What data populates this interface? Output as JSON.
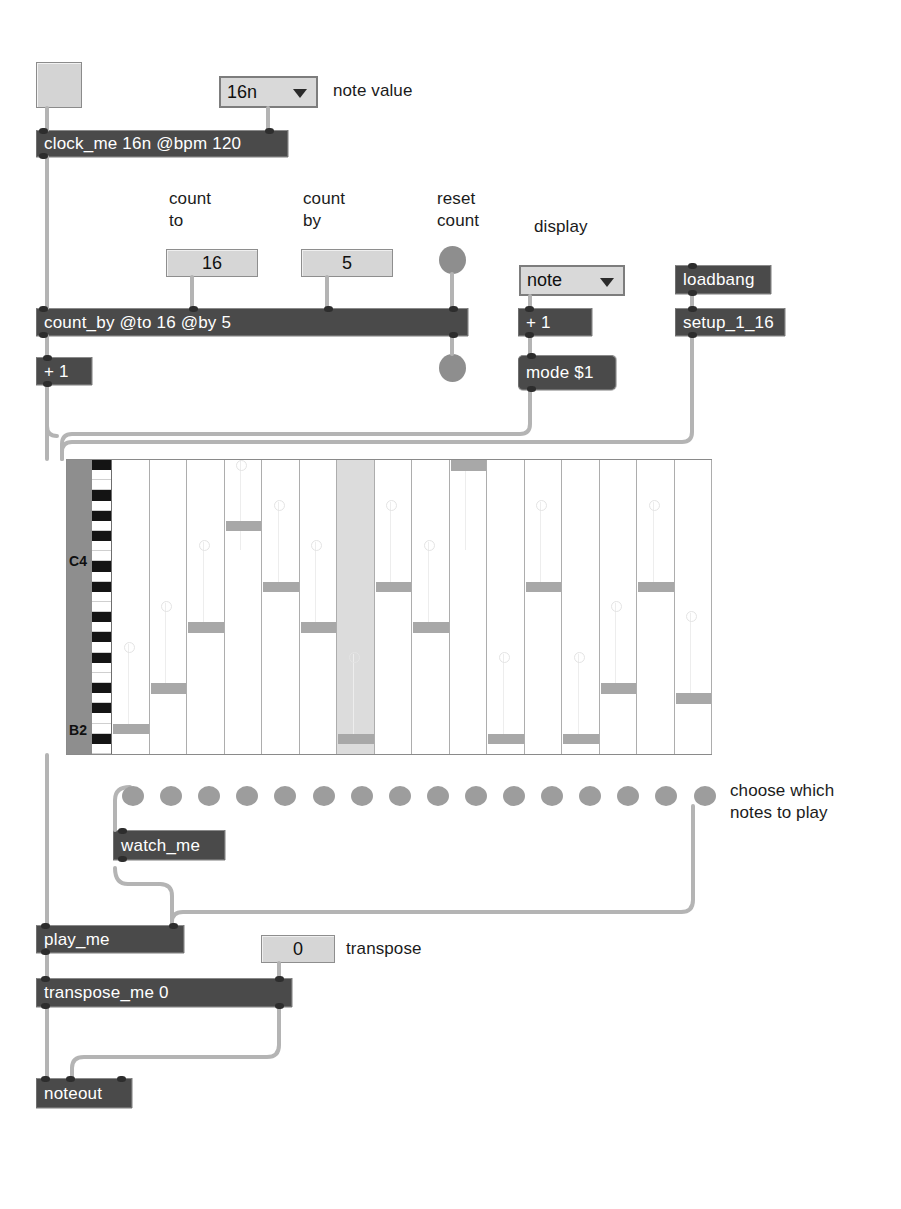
{
  "patch": {
    "title": "step sequencer patch"
  },
  "comments": {
    "note_value": "note value",
    "count_to": "count\nto",
    "count_by": "count\nby",
    "reset_count": "reset\ncount",
    "display": "display",
    "choose_notes": "choose which\nnotes to play",
    "transpose": "transpose"
  },
  "objects": {
    "clock_me": "clock_me 16n @bpm 120",
    "count_by": "count_by @to 16 @by 5",
    "plus_one_left": "+ 1",
    "plus_one_display": "+ 1",
    "mode_msg": "mode $1",
    "loadbang": "loadbang",
    "setup": "setup_1_16",
    "watch_me": "watch_me",
    "play_me": "play_me",
    "transpose_me": "transpose_me 0",
    "noteout": "noteout"
  },
  "controls": {
    "note_value_menu": {
      "value": "16n",
      "icon": "chevron-down-icon"
    },
    "display_menu": {
      "value": "note",
      "icon": "chevron-down-icon"
    },
    "count_to_number": "16",
    "count_by_number": "5",
    "transpose_number": "0",
    "start_toggle": {
      "state": "off"
    },
    "reset_bang_top": {
      "label": "bang"
    },
    "reset_bang_bottom": {
      "label": "bang"
    }
  },
  "colors": {
    "object_fill": "#4a4a4a",
    "object_text": "#ffffff",
    "widget_fill": "#d6d6d6",
    "cord": "#b4b4b4",
    "note_fill": "#a8a8a8",
    "playhead_fill": "#dcdcdc",
    "keyspine_fill": "#8e8e8e",
    "dot_fill": "#9d9d9d",
    "background": "#ffffff"
  },
  "sequencer": {
    "steps": 16,
    "pitch_top_label": "C4",
    "pitch_bottom_label": "B2",
    "playhead_step": 7,
    "rows": 29,
    "notes": [
      {
        "step": 1,
        "row": 26
      },
      {
        "step": 2,
        "row": 22
      },
      {
        "step": 3,
        "row": 16
      },
      {
        "step": 4,
        "row": 6
      },
      {
        "step": 5,
        "row": 12
      },
      {
        "step": 6,
        "row": 16
      },
      {
        "step": 7,
        "row": 27
      },
      {
        "step": 8,
        "row": 12
      },
      {
        "step": 9,
        "row": 16
      },
      {
        "step": 10,
        "row": 0
      },
      {
        "step": 11,
        "row": 27
      },
      {
        "step": 12,
        "row": 12
      },
      {
        "step": 13,
        "row": 27
      },
      {
        "step": 14,
        "row": 22
      },
      {
        "step": 15,
        "row": 12
      },
      {
        "step": 16,
        "row": 23
      }
    ],
    "note_toggles": [
      {
        "index": 1,
        "state": "on"
      },
      {
        "index": 2,
        "state": "on"
      },
      {
        "index": 3,
        "state": "on"
      },
      {
        "index": 4,
        "state": "on"
      },
      {
        "index": 5,
        "state": "on"
      },
      {
        "index": 6,
        "state": "on"
      },
      {
        "index": 7,
        "state": "on"
      },
      {
        "index": 8,
        "state": "on"
      },
      {
        "index": 9,
        "state": "on"
      },
      {
        "index": 10,
        "state": "on"
      },
      {
        "index": 11,
        "state": "on"
      },
      {
        "index": 12,
        "state": "on"
      },
      {
        "index": 13,
        "state": "on"
      },
      {
        "index": 14,
        "state": "on"
      },
      {
        "index": 15,
        "state": "on"
      },
      {
        "index": 16,
        "state": "on"
      }
    ]
  }
}
